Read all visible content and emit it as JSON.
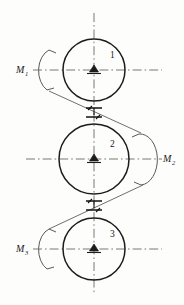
{
  "figure": {
    "background_color": "#fdfdfc",
    "line_color": "#1c1c1c",
    "axis_color": "#6a6a6a",
    "width": 184,
    "height": 305
  },
  "gears": [
    {
      "id": "gear-1",
      "number_label": "1",
      "cx": 94,
      "cy": 70,
      "r": 31,
      "number_x": 110,
      "number_y": 58,
      "axis_x1": 33,
      "axis_x2": 162,
      "axis_y": 70
    },
    {
      "id": "gear-2",
      "number_label": "2",
      "cx": 94,
      "cy": 159,
      "r": 35,
      "number_x": 110,
      "number_y": 147,
      "axis_x1": 26,
      "axis_x2": 162,
      "axis_y": 159
    },
    {
      "id": "gear-3",
      "number_label": "3",
      "cx": 94,
      "cy": 249,
      "r": 31,
      "number_x": 110,
      "number_y": 237,
      "axis_x1": 33,
      "axis_x2": 162,
      "axis_y": 249
    }
  ],
  "moments": [
    {
      "id": "moment-1",
      "base": "M",
      "subscript": "1",
      "label": "M1",
      "text_x": 16,
      "text_y": 73,
      "side": "left",
      "arc_cx": 63,
      "arc_cy": 70,
      "arc_rx": 14,
      "arc_ry": 24,
      "direction": "counterclockwise"
    },
    {
      "id": "moment-2",
      "base": "M",
      "subscript": "2",
      "label": "M2",
      "text_x": 163,
      "text_y": 162,
      "side": "right",
      "arc_cx": 130,
      "arc_cy": 159,
      "arc_rx": 14,
      "arc_ry": 26,
      "direction": "clockwise"
    },
    {
      "id": "moment-3",
      "base": "M",
      "subscript": "3",
      "label": "M3",
      "text_x": 16,
      "text_y": 252,
      "side": "left",
      "arc_cx": 63,
      "arc_cy": 249,
      "arc_rx": 14,
      "arc_ry": 24,
      "direction": "counterclockwise"
    }
  ],
  "mesh_points": [
    {
      "id": "mesh-1-2",
      "x": 94,
      "y": 113,
      "between": "1-2"
    },
    {
      "id": "mesh-2-3",
      "x": 94,
      "y": 206,
      "between": "2-3"
    }
  ],
  "pressure_lines": [
    {
      "id": "pressure-line-upper",
      "x1": 49,
      "y1": 91,
      "x2": 141,
      "y2": 133
    },
    {
      "id": "pressure-line-lower",
      "x1": 49,
      "y1": 229,
      "x2": 143,
      "y2": 185
    }
  ],
  "center_axis": {
    "id": "vertical-center-axis",
    "x": 94,
    "y1": 13,
    "y2": 295
  }
}
